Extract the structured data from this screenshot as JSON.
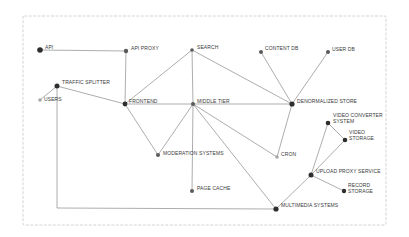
{
  "diagram": {
    "type": "system-architecture-graph",
    "frame": {
      "x": 23,
      "y": 16,
      "width": 363,
      "height": 209
    },
    "colors": {
      "edge": "#8a8a8a",
      "node_dark": "#2e2e2e",
      "node_mid": "#5a5a5a",
      "node_light": "#a8a8a8",
      "label": "#3a3a3a",
      "frame": "#c9c9c9"
    },
    "nodes": [
      {
        "id": "api",
        "label": "API",
        "x": 40,
        "y": 50,
        "r": 2.8,
        "tone": "dark"
      },
      {
        "id": "api_proxy",
        "label": "API PROXY",
        "x": 126,
        "y": 51,
        "r": 2.2,
        "tone": "mid"
      },
      {
        "id": "search",
        "label": "SEARCH",
        "x": 192,
        "y": 50,
        "r": 1.8,
        "tone": "mid"
      },
      {
        "id": "content_db",
        "label": "CONTENT DB",
        "x": 261,
        "y": 52,
        "r": 2.0,
        "tone": "mid"
      },
      {
        "id": "user_db",
        "label": "USER DB",
        "x": 328,
        "y": 52,
        "r": 2.0,
        "tone": "mid"
      },
      {
        "id": "traffic_splitter",
        "label": "TRAFFIC SPLITTER",
        "x": 57,
        "y": 86,
        "r": 2.5,
        "tone": "dark"
      },
      {
        "id": "users",
        "label": "USERS",
        "x": 40,
        "y": 100,
        "r": 1.8,
        "tone": "light"
      },
      {
        "id": "frontend",
        "label": "FRONTEND",
        "x": 125,
        "y": 104,
        "r": 2.4,
        "tone": "dark"
      },
      {
        "id": "middle_tier",
        "label": "MIDDLE TIER",
        "x": 193,
        "y": 104,
        "r": 2.0,
        "tone": "mid"
      },
      {
        "id": "denormalized_store",
        "label": "DENORMALIZED STORE",
        "x": 292,
        "y": 104,
        "r": 2.6,
        "tone": "dark"
      },
      {
        "id": "video_converter",
        "label": "VIDEO CONVERTER SYSTEM",
        "x": 328,
        "y": 123,
        "r": 2.3,
        "tone": "dark"
      },
      {
        "id": "video_storage",
        "label": "VIDEO STORAGE",
        "x": 345,
        "y": 140,
        "r": 2.3,
        "tone": "dark"
      },
      {
        "id": "moderation",
        "label": "MODERATION SYSTEMS",
        "x": 158,
        "y": 155,
        "r": 2.0,
        "tone": "mid"
      },
      {
        "id": "cron",
        "label": "CRON",
        "x": 277,
        "y": 157,
        "r": 1.8,
        "tone": "light"
      },
      {
        "id": "upload_proxy",
        "label": "UPLOAD PROXY SERVICE",
        "x": 311,
        "y": 175,
        "r": 2.5,
        "tone": "dark"
      },
      {
        "id": "record_storage",
        "label": "RECORD STORAGE",
        "x": 344,
        "y": 191,
        "r": 2.2,
        "tone": "dark"
      },
      {
        "id": "page_cache",
        "label": "PAGE CACHE",
        "x": 192,
        "y": 191,
        "r": 2.0,
        "tone": "mid"
      },
      {
        "id": "multimedia",
        "label": "MULTIMEDIA SYSTEMS",
        "x": 276,
        "y": 209,
        "r": 2.6,
        "tone": "dark"
      }
    ],
    "labels": [
      {
        "node": "api",
        "lines": [
          "API"
        ],
        "x": 45,
        "y": 49
      },
      {
        "node": "api_proxy",
        "lines": [
          "API PROXY"
        ],
        "x": 131,
        "y": 50
      },
      {
        "node": "search",
        "lines": [
          "SEARCH"
        ],
        "x": 197,
        "y": 49
      },
      {
        "node": "content_db",
        "lines": [
          "CONTENT DB"
        ],
        "x": 265,
        "y": 50
      },
      {
        "node": "user_db",
        "lines": [
          "USER DB"
        ],
        "x": 332,
        "y": 51
      },
      {
        "node": "traffic_splitter",
        "lines": [
          "TRAFFIC SPLITTER"
        ],
        "x": 62,
        "y": 84
      },
      {
        "node": "users",
        "lines": [
          "USERS"
        ],
        "x": 44,
        "y": 101
      },
      {
        "node": "frontend",
        "lines": [
          "FRONTEND"
        ],
        "x": 129,
        "y": 103
      },
      {
        "node": "middle_tier",
        "lines": [
          "MIDDLE TIER"
        ],
        "x": 197,
        "y": 103
      },
      {
        "node": "denormalized_store",
        "lines": [
          "DENORMALIZED STORE"
        ],
        "x": 297,
        "y": 103
      },
      {
        "node": "video_converter",
        "lines": [
          "VIDEO CONVERTER",
          "SYSTEM"
        ],
        "x": 333,
        "y": 117
      },
      {
        "node": "video_storage",
        "lines": [
          "VIDEO",
          "STORAGE"
        ],
        "x": 349,
        "y": 134
      },
      {
        "node": "moderation",
        "lines": [
          "MODERATION SYSTEMS"
        ],
        "x": 163,
        "y": 155
      },
      {
        "node": "cron",
        "lines": [
          "CRON"
        ],
        "x": 281,
        "y": 156
      },
      {
        "node": "upload_proxy",
        "lines": [
          "UPLOAD PROXY SERVICE"
        ],
        "x": 316,
        "y": 173
      },
      {
        "node": "record_storage",
        "lines": [
          "RECORD",
          "STORAGE"
        ],
        "x": 348,
        "y": 187
      },
      {
        "node": "page_cache",
        "lines": [
          "PAGE CACHE"
        ],
        "x": 197,
        "y": 190
      },
      {
        "node": "multimedia",
        "lines": [
          "MULTIMEDIA SYSTEMS"
        ],
        "x": 281,
        "y": 207
      }
    ],
    "edges": [
      {
        "from": "api",
        "to": "api_proxy"
      },
      {
        "from": "api_proxy",
        "to": "frontend"
      },
      {
        "from": "users",
        "to": "traffic_splitter"
      },
      {
        "from": "traffic_splitter",
        "to": "frontend"
      },
      {
        "from": "traffic_splitter",
        "to": "multimedia",
        "route": [
          [
            57,
            86
          ],
          [
            57,
            208
          ],
          [
            276,
            209
          ]
        ]
      },
      {
        "from": "frontend",
        "to": "search"
      },
      {
        "from": "frontend",
        "to": "middle_tier"
      },
      {
        "from": "frontend",
        "to": "moderation"
      },
      {
        "from": "middle_tier",
        "to": "search"
      },
      {
        "from": "middle_tier",
        "to": "moderation"
      },
      {
        "from": "middle_tier",
        "to": "page_cache"
      },
      {
        "from": "middle_tier",
        "to": "denormalized_store"
      },
      {
        "from": "middle_tier",
        "to": "cron"
      },
      {
        "from": "middle_tier",
        "to": "multimedia"
      },
      {
        "from": "search",
        "to": "denormalized_store"
      },
      {
        "from": "content_db",
        "to": "denormalized_store"
      },
      {
        "from": "user_db",
        "to": "denormalized_store"
      },
      {
        "from": "denormalized_store",
        "to": "cron"
      },
      {
        "from": "multimedia",
        "to": "upload_proxy"
      },
      {
        "from": "upload_proxy",
        "to": "video_converter"
      },
      {
        "from": "upload_proxy",
        "to": "video_storage"
      },
      {
        "from": "video_converter",
        "to": "video_storage"
      },
      {
        "from": "upload_proxy",
        "to": "record_storage"
      }
    ]
  }
}
